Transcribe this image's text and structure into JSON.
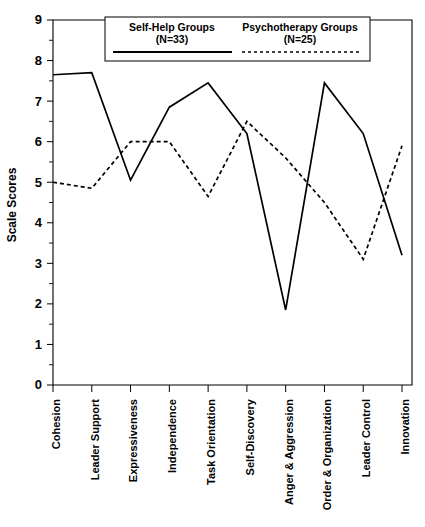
{
  "chart_data": {
    "type": "line",
    "title": "",
    "xlabel": "",
    "ylabel": "Scale Scores",
    "ylim": [
      0,
      9
    ],
    "ytick_labels": [
      "0",
      "1",
      "2",
      "3",
      "4",
      "5",
      "6",
      "7",
      "8",
      "9"
    ],
    "ytick_values": [
      0,
      1,
      2,
      3,
      4,
      5,
      6,
      7,
      8,
      9
    ],
    "minor_tick_step": 0.5,
    "grid": false,
    "legend_position": "top-center",
    "categories": [
      "Cohesion",
      "Leader Support",
      "Expressiveness",
      "Independence",
      "Task Orientation",
      "Self-Discovery",
      "Anger & Aggression",
      "Order & Organization",
      "Leader Control",
      "Innovation"
    ],
    "series": [
      {
        "name": "Self-Help Groups",
        "n_label": "(N=33)",
        "style": "solid",
        "color": "#000000",
        "values": [
          7.65,
          7.7,
          5.05,
          6.85,
          7.45,
          6.2,
          1.85,
          7.45,
          6.2,
          3.2
        ]
      },
      {
        "name": "Psychotherapy Groups",
        "n_label": "(N=25)",
        "style": "dashed",
        "color": "#000000",
        "values": [
          5.0,
          4.85,
          6.0,
          6.0,
          4.65,
          6.5,
          5.6,
          4.5,
          3.1,
          5.9
        ]
      }
    ]
  },
  "legend": {
    "entries": [
      {
        "label": "Self-Help Groups",
        "sub": "(N=33)",
        "style": "solid"
      },
      {
        "label": "Psychotherapy Groups",
        "sub": "(N=25)",
        "style": "dashed"
      }
    ]
  },
  "axis": {
    "y_title": "Scale Scores"
  }
}
